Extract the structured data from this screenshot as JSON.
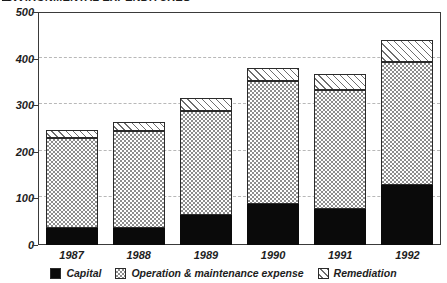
{
  "title": {
    "text": "ENVIRONMENTAL EXPENDITURES",
    "clipped": true,
    "swatch_icon": "black-square-icon"
  },
  "chart_data": {
    "type": "bar",
    "stacked": true,
    "title": "ENVIRONMENTAL EXPENDITURES",
    "xlabel": "",
    "ylabel": "",
    "categories": [
      "1987",
      "1988",
      "1989",
      "1990",
      "1991",
      "1992"
    ],
    "series": [
      {
        "name": "Capital",
        "values": [
          37,
          37,
          65,
          88,
          77,
          128
        ]
      },
      {
        "name": "Operation & maintenance expense",
        "values": [
          193,
          208,
          223,
          264,
          256,
          265
        ]
      },
      {
        "name": "Remediation",
        "values": [
          17,
          18,
          27,
          28,
          35,
          47
        ]
      }
    ],
    "totals": [
      247,
      263,
      315,
      380,
      368,
      440
    ],
    "ylim": [
      0,
      500
    ],
    "yticks": [
      0,
      100,
      200,
      300,
      400,
      500
    ],
    "ytick_labels": [
      "0",
      "100",
      "200",
      "300",
      "400",
      "500"
    ],
    "grid": true,
    "grid_style": "dashed-horizontal",
    "legend_position": "bottom-center",
    "colors": {
      "capital": "#0a0a0a",
      "om": "#8d8d8d",
      "remediation": "#6e6e6e",
      "axis": "#3a3a3a",
      "gridline": "#b8b8b8",
      "background": "#ffffff",
      "text": "#1d1d1d"
    },
    "patterns": {
      "capital": "solid-black",
      "om": "checkerboard",
      "remediation": "diagonal-hatch"
    }
  },
  "legend": {
    "items": [
      {
        "label": "Capital",
        "pattern": "solid-black",
        "icon": "solid-square-icon"
      },
      {
        "label": "Operation & maintenance expense",
        "pattern": "checkerboard",
        "icon": "checkered-square-icon"
      },
      {
        "label": "Remediation",
        "pattern": "diagonal-hatch",
        "icon": "hatched-square-icon"
      }
    ]
  }
}
